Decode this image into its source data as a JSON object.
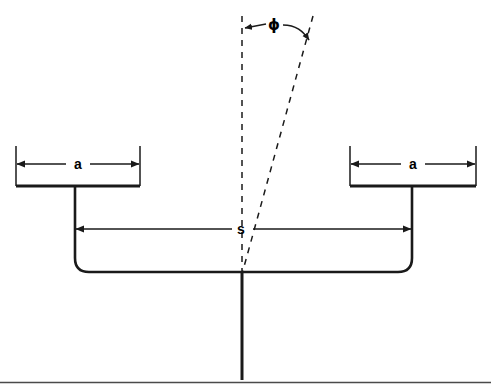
{
  "figure": {
    "type": "technical-line-diagram",
    "background_color": "#ffffff",
    "stroke_color": "#1a1a1a",
    "width": 491,
    "height": 392
  },
  "labels": {
    "left_gap": "a",
    "right_gap": "a",
    "separation": "s",
    "angle": "ɸ"
  },
  "geometry": {
    "left_plate": {
      "x1": 16,
      "x2": 140,
      "y": 186
    },
    "right_plate": {
      "x1": 350,
      "x2": 476,
      "y": 186
    },
    "left_dim_a": {
      "x1": 16,
      "x2": 140,
      "y": 163
    },
    "right_dim_a": {
      "x1": 350,
      "x2": 476,
      "y": 163
    },
    "dim_s": {
      "x1": 75,
      "x2": 412,
      "y": 229
    },
    "bracket": {
      "x1": 75,
      "x2": 412,
      "y_top": 186,
      "y_bottom": 272,
      "corner_radius": 14
    },
    "base_bar": {
      "x1": 75,
      "x2": 412,
      "y": 272
    },
    "stem": {
      "x": 242,
      "y1": 272,
      "y2": 380
    },
    "ground_rule": {
      "x1": 0,
      "x2": 491,
      "y": 382
    },
    "vertex": {
      "x": 242,
      "y": 272
    },
    "dashed_vertical": {
      "x1": 242,
      "y1": 18,
      "x2": 242,
      "y2": 272
    },
    "dashed_tilted": {
      "x1": 312,
      "y1": 18,
      "x2": 242,
      "y2": 272
    },
    "angle_arc": {
      "center_x": 242,
      "center_y": 272,
      "label_x": 272,
      "label_y": 26
    }
  },
  "colors": {
    "line": "#1a1a1a",
    "dashed": "#1a1a1a",
    "background": "#ffffff",
    "ground": "#4a4a4a"
  }
}
